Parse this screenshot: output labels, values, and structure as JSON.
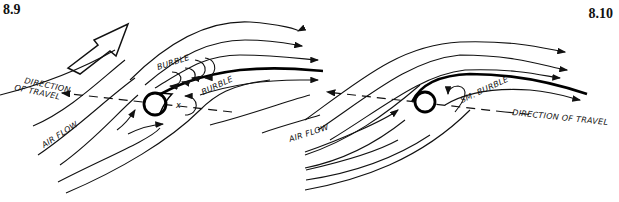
{
  "figures": [
    {
      "number": "8.9",
      "labels": {
        "direction_line1": "DIRECTION",
        "direction_line2": "OF TRAVEL",
        "burble_top": "BURBLE",
        "burble_lower": "BURBLE",
        "air_flow": "AIR FLOW"
      },
      "icons": [
        "flow-direction-arrow-icon"
      ]
    },
    {
      "number": "8.10",
      "labels": {
        "small_burble": "SM. BURBLE",
        "direction": "DIRECTION OF TRAVEL",
        "air_flow": "AIR FLOW"
      }
    }
  ],
  "colors": {
    "ink": "#111111",
    "background": "#ffffff"
  }
}
